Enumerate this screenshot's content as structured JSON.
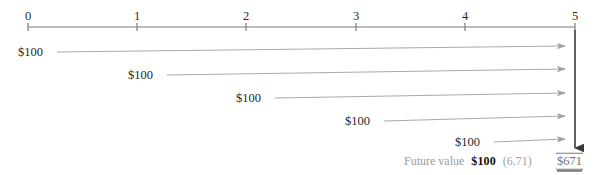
{
  "figure": {
    "type": "timeline-cashflow-diagram",
    "title": "",
    "timeline": {
      "axis_y": 27,
      "x_start": 28,
      "x_end": 575,
      "tick_labels": [
        "0",
        "1",
        "2",
        "3",
        "4",
        "5"
      ],
      "tick_positions": [
        28,
        137,
        246,
        356,
        465,
        575
      ],
      "label_y": 10,
      "axis_color": "#7c7c7c"
    },
    "cash_flows": [
      {
        "label": "$100",
        "period": 0,
        "label_x": 18,
        "arrow_x_start": 57,
        "arrow_y_start": 52,
        "arrow_x_end": 565,
        "arrow_y_end": 46
      },
      {
        "label": "$100",
        "period": 1,
        "label_x": 128,
        "arrow_x_start": 167,
        "arrow_y_start": 75,
        "arrow_x_end": 565,
        "arrow_y_end": 69
      },
      {
        "label": "$100",
        "period": 2,
        "label_x": 236,
        "arrow_x_start": 275,
        "arrow_y_start": 98,
        "arrow_x_end": 565,
        "arrow_y_end": 93
      },
      {
        "label": "$100",
        "period": 3,
        "label_x": 345,
        "arrow_x_start": 384,
        "arrow_y_start": 121,
        "arrow_x_end": 565,
        "arrow_y_end": 116
      },
      {
        "label": "$100",
        "period": 4,
        "label_x": 455,
        "arrow_x_start": 494,
        "arrow_y_start": 142,
        "arrow_x_end": 565,
        "arrow_y_end": 139
      }
    ],
    "future_value_arrow": {
      "x": 575,
      "y_start": 30,
      "y_end": 148,
      "color": "#3a3a3a"
    },
    "summary": {
      "caption": "Future value",
      "payment": "$100",
      "factor": "(6.71)",
      "total": "$671",
      "caption_x": 404,
      "payment_x": 466,
      "factor_x": 505,
      "total_x": 556,
      "row_y": 161
    },
    "colors": {
      "arrow_gray": "#a8a8a8",
      "axis_gray": "#7c7c7c",
      "text_dark": "#1f1f1f",
      "text_gray": "#9b9b9b",
      "total_gray": "#6f6f6f"
    }
  }
}
